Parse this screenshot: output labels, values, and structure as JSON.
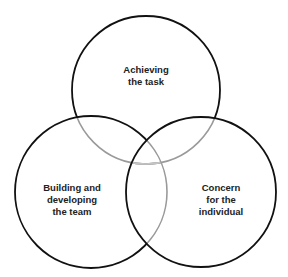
{
  "diagram": {
    "type": "venn",
    "circles": [
      {
        "id": "task",
        "label_lines": [
          "Achieving",
          "the task"
        ],
        "cx": 146,
        "cy": 90,
        "r": 74
      },
      {
        "id": "team",
        "label_lines": [
          "Building and",
          "developing",
          "the team"
        ],
        "cx": 91,
        "cy": 192,
        "r": 76
      },
      {
        "id": "individual",
        "label_lines": [
          "Concern",
          "for the",
          "individual"
        ],
        "cx": 201,
        "cy": 192,
        "r": 75
      }
    ],
    "colors": {
      "outline": "#111111",
      "overlap_arc": "#9a9a9a",
      "overlap_arc_light": "#c4c4c4",
      "text": "#222222",
      "background": "#ffffff"
    }
  }
}
